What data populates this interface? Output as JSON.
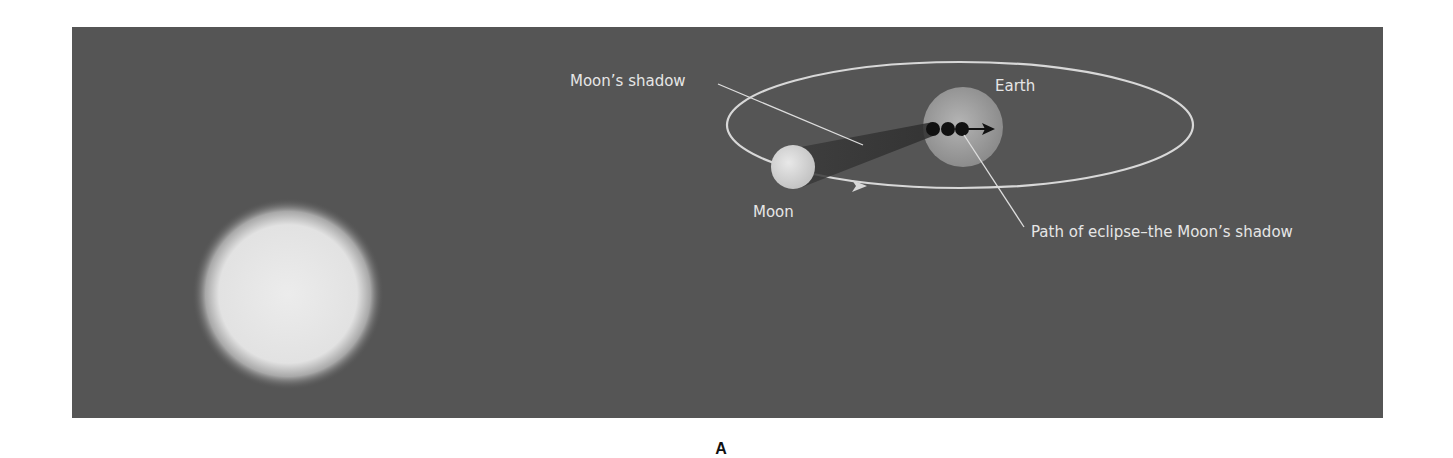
{
  "figure": {
    "panel_letter": "A",
    "background_color": "#555555",
    "labels": {
      "moons_shadow": "Moon’s shadow",
      "earth": "Earth",
      "moon": "Moon",
      "path_of_eclipse": "Path of eclipse–the Moon’s shadow"
    },
    "objects": [
      {
        "name": "Sun",
        "shape": "circle",
        "color": "#e4e4e4"
      },
      {
        "name": "Moon",
        "shape": "circle",
        "color": "#dcdcdc"
      },
      {
        "name": "Earth",
        "shape": "circle",
        "color": "#a8a8a8"
      },
      {
        "name": "Moon orbit",
        "shape": "ellipse",
        "color": "#d8d8d8"
      },
      {
        "name": "Moon's shadow cone",
        "shape": "cone",
        "color": "#3c3c3c"
      },
      {
        "name": "Eclipse path dots",
        "count": 3,
        "color": "#111111"
      }
    ]
  }
}
